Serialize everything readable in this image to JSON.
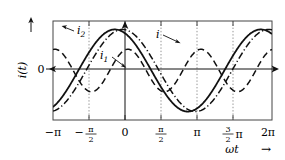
{
  "figure": {
    "title": "",
    "y_axis_label": "i(t)",
    "y_zero_label": "0",
    "x_axis_label": "ωt",
    "x_axis_arrow": "→",
    "y_axis_arrow": "↑"
  },
  "curve_labels": {
    "i": "i",
    "i1": "i₁",
    "i2": "i₂",
    "i_base": "i",
    "i1_base": "i",
    "i1_sub": "1",
    "i2_base": "i",
    "i2_sub": "2"
  },
  "x_ticks": [
    {
      "value": -3.14159265,
      "label": "−π",
      "type": "plain"
    },
    {
      "value": -1.57079633,
      "label": "−π/2",
      "type": "fraction",
      "sign": "−",
      "num": "π",
      "den": "2"
    },
    {
      "value": 0.0,
      "label": "0",
      "type": "plain"
    },
    {
      "value": 1.57079633,
      "label": "π/2",
      "type": "fraction",
      "sign": "",
      "num": "π",
      "den": "2"
    },
    {
      "value": 3.14159265,
      "label": "π",
      "type": "plain"
    },
    {
      "value": 4.71238898,
      "label": "3/2π",
      "type": "fraction-suffix",
      "sign": "",
      "num": "3",
      "den": "2",
      "suffix": "π"
    },
    {
      "value": 6.28318531,
      "label": "2π",
      "type": "plain"
    }
  ],
  "chart_data": {
    "type": "line",
    "title": "",
    "xlabel": "ωt",
    "ylabel": "i(t)",
    "xlim": [
      -3.14159265,
      6.28318531
    ],
    "ylim": [
      -1.35,
      1.35
    ],
    "grid": "vertical-dotted-at-halfpi-multiples",
    "legend": "inline-annotations",
    "x_tick_labels": [
      "−π",
      "−π/2",
      "0",
      "π/2",
      "π",
      "3π/2",
      "2π"
    ],
    "x_tick_values": [
      -3.14159265,
      -1.57079633,
      0,
      1.57079633,
      3.14159265,
      4.71238898,
      6.28318531
    ],
    "y_tick_labels": [
      "0"
    ],
    "y_tick_values": [
      0
    ],
    "series": [
      {
        "name": "i",
        "style": "solid",
        "color": "#111111",
        "width": 1.8,
        "formula": "1.12*sin(x + 2.05)",
        "amplitude": 1.12,
        "frequency": 1,
        "phase": 2.05,
        "points": [
          {
            "x": -3.1416,
            "y": 0.99
          },
          {
            "x": -2.7489,
            "y": 1.12
          },
          {
            "x": -2.3562,
            "y": 1.06
          },
          {
            "x": -1.9635,
            "y": 0.79
          },
          {
            "x": -1.5708,
            "y": 0.37
          },
          {
            "x": -1.1781,
            "y": -0.11
          },
          {
            "x": -0.7854,
            "y": -0.58
          },
          {
            "x": -0.3927,
            "y": -0.93
          },
          {
            "x": 0.0,
            "y": -1.1
          },
          {
            "x": 0.3927,
            "y": -1.08
          },
          {
            "x": 0.7854,
            "y": -0.87
          },
          {
            "x": 1.1781,
            "y": -0.5
          },
          {
            "x": 1.5708,
            "y": -0.03
          },
          {
            "x": 1.9635,
            "y": 0.45
          },
          {
            "x": 2.3562,
            "y": 0.84
          },
          {
            "x": 2.7489,
            "y": 1.07
          },
          {
            "x": 3.1416,
            "y": 1.11
          },
          {
            "x": 3.5343,
            "y": 0.95
          },
          {
            "x": 3.927,
            "y": 0.61
          },
          {
            "x": 4.3197,
            "y": 0.16
          },
          {
            "x": 4.7124,
            "y": -0.33
          },
          {
            "x": 5.1051,
            "y": -0.75
          },
          {
            "x": 5.4978,
            "y": -1.02
          },
          {
            "x": 5.8905,
            "y": -1.12
          },
          {
            "x": 6.2832,
            "y": -1.0
          }
        ]
      },
      {
        "name": "i1",
        "style": "dashed",
        "color": "#111111",
        "width": 1.5,
        "formula": "0.58*sin(2x + 1.4)",
        "amplitude": 0.58,
        "frequency": 2,
        "phase": 1.4,
        "points": [
          {
            "x": -3.1416,
            "y": 0.1
          },
          {
            "x": -2.7489,
            "y": -0.29
          },
          {
            "x": -2.3562,
            "y": -0.54
          },
          {
            "x": -1.9635,
            "y": -0.57
          },
          {
            "x": -1.5708,
            "y": -0.37
          },
          {
            "x": -1.1781,
            "y": -0.01
          },
          {
            "x": -0.7854,
            "y": 0.35
          },
          {
            "x": -0.3927,
            "y": 0.56
          },
          {
            "x": 0.0,
            "y": 0.57
          },
          {
            "x": 0.3927,
            "y": 0.37
          },
          {
            "x": 0.7854,
            "y": 0.02
          },
          {
            "x": 1.1781,
            "y": -0.34
          },
          {
            "x": 1.5708,
            "y": -0.56
          },
          {
            "x": 1.9635,
            "y": -0.57
          },
          {
            "x": 2.3562,
            "y": -0.38
          },
          {
            "x": 2.7489,
            "y": -0.03
          },
          {
            "x": 3.1416,
            "y": 0.33
          },
          {
            "x": 3.5343,
            "y": 0.55
          },
          {
            "x": 3.927,
            "y": 0.58
          },
          {
            "x": 4.3197,
            "y": 0.39
          },
          {
            "x": 4.7124,
            "y": 0.04
          },
          {
            "x": 5.1051,
            "y": -0.32
          },
          {
            "x": 5.4978,
            "y": -0.55
          },
          {
            "x": 5.8905,
            "y": -0.58
          },
          {
            "x": 6.2832,
            "y": -0.4
          }
        ]
      },
      {
        "name": "i2",
        "style": "dash-dot",
        "color": "#111111",
        "width": 1.5,
        "formula": "1.12*sin(x + 1.72)",
        "amplitude": 1.12,
        "frequency": 1,
        "phase": 1.72,
        "points": [
          {
            "x": -3.1416,
            "y": 1.11
          },
          {
            "x": -2.7489,
            "y": 1.12
          },
          {
            "x": -2.3562,
            "y": 0.93
          },
          {
            "x": -1.9635,
            "y": 0.58
          },
          {
            "x": -1.5708,
            "y": 0.13
          },
          {
            "x": -1.1781,
            "y": -0.36
          },
          {
            "x": -0.7854,
            "y": -0.77
          },
          {
            "x": -0.3927,
            "y": -1.03
          },
          {
            "x": 0.0,
            "y": -1.11
          },
          {
            "x": 0.3927,
            "y": -0.99
          },
          {
            "x": 0.7854,
            "y": -0.69
          },
          {
            "x": 1.1781,
            "y": -0.26
          },
          {
            "x": 1.5708,
            "y": 0.23
          },
          {
            "x": 1.9635,
            "y": 0.66
          },
          {
            "x": 2.3562,
            "y": 0.97
          },
          {
            "x": 2.7489,
            "y": 1.12
          },
          {
            "x": 3.1416,
            "y": 1.08
          },
          {
            "x": 3.5343,
            "y": 0.85
          },
          {
            "x": 3.927,
            "y": 0.46
          },
          {
            "x": 4.3197,
            "y": -0.01
          },
          {
            "x": 4.7124,
            "y": -0.48
          },
          {
            "x": 5.1051,
            "y": -0.86
          },
          {
            "x": 5.4978,
            "y": -1.08
          },
          {
            "x": 5.8905,
            "y": -1.12
          },
          {
            "x": 6.2832,
            "y": -0.95
          }
        ]
      }
    ],
    "annotations": [
      {
        "text": "i",
        "series": "i",
        "x_px": 157,
        "y_px": 36,
        "leader_to_x": 180,
        "leader_to_y": 44
      },
      {
        "text": "i1",
        "series": "i1",
        "x_px": 103,
        "y_px": 56,
        "leader_to_x": 124,
        "leader_to_y": 66
      },
      {
        "text": "i2",
        "series": "i2",
        "x_px": 76,
        "y_px": 30,
        "leader_to_x": 60,
        "leader_to_y": 27
      }
    ]
  }
}
